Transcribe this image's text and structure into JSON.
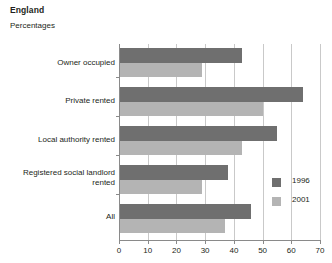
{
  "header": {
    "title": "England",
    "subtitle": "Percentages"
  },
  "chart_data": {
    "type": "bar",
    "orientation": "horizontal",
    "title": "England",
    "subtitle": "Percentages",
    "xlabel": "",
    "ylabel": "",
    "xlim": [
      0,
      70
    ],
    "xticks": [
      0,
      10,
      20,
      30,
      40,
      50,
      60,
      70
    ],
    "grid": true,
    "grid_axis": "x",
    "legend_position": "right",
    "categories": [
      "Owner occupied",
      "Private rented",
      "Local authority rented",
      "Registered social landlord rented",
      "All"
    ],
    "series": [
      {
        "name": "1996",
        "color": "#6f6f6f",
        "values": [
          43,
          64,
          55,
          38,
          46
        ]
      },
      {
        "name": "2001",
        "color": "#b4b4b4",
        "values": [
          29,
          50,
          43,
          29,
          37
        ]
      }
    ]
  },
  "legend": {
    "items": [
      {
        "label": "1996"
      },
      {
        "label": "2001"
      }
    ]
  },
  "axis": {
    "tick_labels": [
      "0",
      "10",
      "20",
      "30",
      "40",
      "50",
      "60",
      "70"
    ]
  },
  "category_labels": {
    "owner_occupied": "Owner occupied",
    "private_rented": "Private rented",
    "local_authority_rented": "Local authority rented",
    "registered_social_landlord_line1": "Registered social landlord",
    "registered_social_landlord_line2": "rented",
    "all": "All"
  }
}
